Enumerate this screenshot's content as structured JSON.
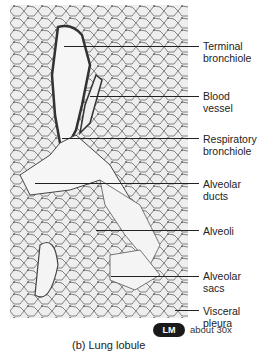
{
  "figure": {
    "caption": "(b) Lung lobule",
    "magnification_badge": "LM",
    "magnification_text": "about 30x"
  },
  "labels": [
    {
      "text_line1": "Terminal",
      "text_line2": "bronchiole"
    },
    {
      "text_line1": "Blood",
      "text_line2": "vessel"
    },
    {
      "text_line1": "Respiratory",
      "text_line2": "bronchiole"
    },
    {
      "text_line1": "Alveolar",
      "text_line2": "ducts"
    },
    {
      "text_line1": "Alveoli",
      "text_line2": ""
    },
    {
      "text_line1": "Alveolar",
      "text_line2": "sacs"
    },
    {
      "text_line1": "Visceral",
      "text_line2": "pleura"
    }
  ]
}
